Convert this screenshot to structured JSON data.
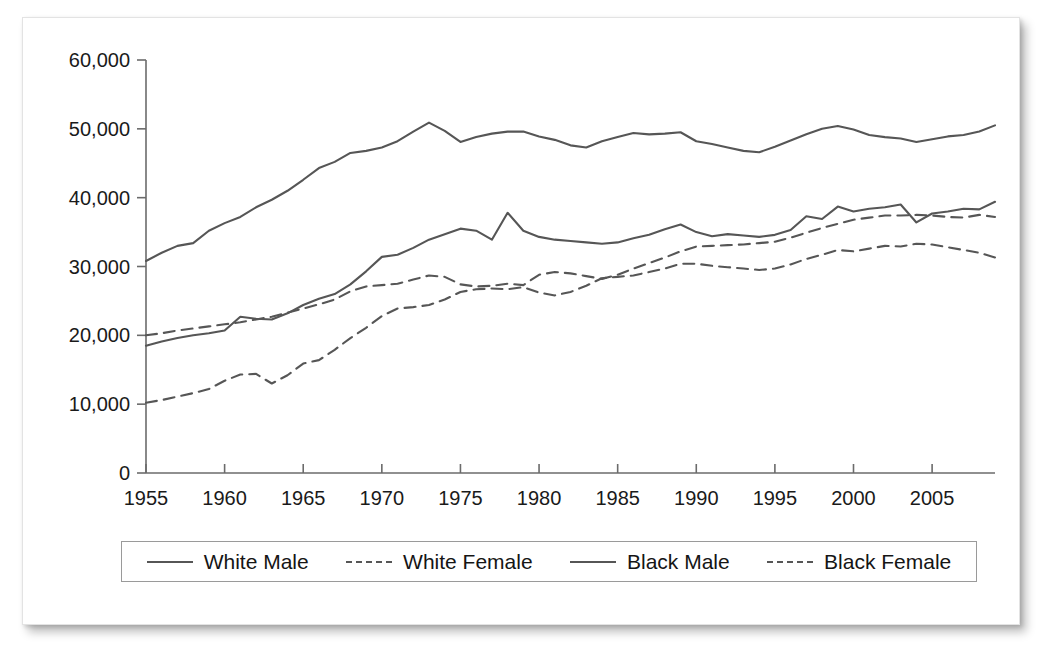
{
  "chart_data": {
    "type": "line",
    "title": "",
    "subtitle": "",
    "xlabel": "",
    "ylabel": "",
    "xlim": [
      1955,
      2009
    ],
    "ylim": [
      0,
      60000
    ],
    "grid": false,
    "legend_position": "bottom",
    "x_ticks": [
      1955,
      1960,
      1965,
      1970,
      1975,
      1980,
      1985,
      1990,
      1995,
      2000,
      2005
    ],
    "x_tick_labels": [
      "1955",
      "1960",
      "1965",
      "1970",
      "1975",
      "1980",
      "1985",
      "1990",
      "1995",
      "2000",
      "2005"
    ],
    "y_ticks": [
      0,
      10000,
      20000,
      30000,
      40000,
      50000,
      60000
    ],
    "y_tick_labels": [
      "0",
      "10,000",
      "20,000",
      "30,000",
      "40,000",
      "50,000",
      "60,000"
    ],
    "x": [
      1955,
      1956,
      1957,
      1958,
      1959,
      1960,
      1961,
      1962,
      1963,
      1964,
      1965,
      1966,
      1967,
      1968,
      1969,
      1970,
      1971,
      1972,
      1973,
      1974,
      1975,
      1976,
      1977,
      1978,
      1979,
      1980,
      1981,
      1982,
      1983,
      1984,
      1985,
      1986,
      1987,
      1988,
      1989,
      1990,
      1991,
      1992,
      1993,
      1994,
      1995,
      1996,
      1997,
      1998,
      1999,
      2000,
      2001,
      2002,
      2003,
      2004,
      2005,
      2006,
      2007,
      2008,
      2009
    ],
    "series": [
      {
        "name": "White Male",
        "style": "solid",
        "color": "#565656",
        "values": [
          30800,
          32000,
          33000,
          33400,
          35200,
          36300,
          37200,
          38600,
          39700,
          41000,
          42600,
          44300,
          45200,
          46500,
          46800,
          47300,
          48200,
          49600,
          50900,
          49700,
          48100,
          48800,
          49300,
          49600,
          49600,
          48900,
          48400,
          47600,
          47300,
          48200,
          48800,
          49400,
          49200,
          49300,
          49500,
          48200,
          47800,
          47300,
          46800,
          46600,
          47400,
          48300,
          49200,
          50000,
          50400,
          49900,
          49100,
          48800,
          48600,
          48100,
          48500,
          48900,
          49100,
          49600,
          50500
        ]
      },
      {
        "name": "White Female",
        "style": "dashed",
        "color": "#565656",
        "values": [
          20000,
          20300,
          20700,
          21000,
          21300,
          21600,
          21900,
          22300,
          22700,
          23300,
          23900,
          24500,
          25200,
          26400,
          27100,
          27300,
          27500,
          28100,
          28700,
          28500,
          27400,
          27100,
          27200,
          27500,
          27300,
          28800,
          29200,
          29000,
          28600,
          28200,
          28800,
          29700,
          30500,
          31300,
          32200,
          32900,
          33000,
          33100,
          33200,
          33400,
          33600,
          34200,
          34900,
          35600,
          36200,
          36800,
          37100,
          37400,
          37400,
          37500,
          37400,
          37200,
          37100,
          37500,
          37200
        ]
      },
      {
        "name": "Black Male",
        "style": "solid",
        "color": "#565656",
        "values": [
          18500,
          19100,
          19600,
          20000,
          20300,
          20700,
          22700,
          22400,
          22300,
          23200,
          24400,
          25300,
          26000,
          27400,
          29300,
          31400,
          31700,
          32700,
          33900,
          34700,
          35500,
          35200,
          33900,
          37800,
          35200,
          34300,
          33900,
          33700,
          33500,
          33300,
          33500,
          34100,
          34600,
          35400,
          36100,
          35000,
          34400,
          34700,
          34500,
          34300,
          34600,
          35300,
          37300,
          36900,
          38700,
          38000,
          38400,
          38600,
          39000,
          36400,
          37700,
          38000,
          38400,
          38300,
          39400
        ]
      },
      {
        "name": "Black Female",
        "style": "dashed",
        "color": "#565656",
        "values": [
          10200,
          10600,
          11100,
          11600,
          12200,
          13400,
          14300,
          14400,
          13000,
          14200,
          15900,
          16400,
          17900,
          19600,
          21100,
          22800,
          23900,
          24100,
          24400,
          25200,
          26300,
          26700,
          26800,
          26700,
          27000,
          26200,
          25800,
          26300,
          27200,
          28300,
          28500,
          28700,
          29200,
          29700,
          30400,
          30400,
          30100,
          29900,
          29700,
          29500,
          29700,
          30300,
          31100,
          31700,
          32400,
          32200,
          32600,
          33000,
          32900,
          33300,
          33200,
          32800,
          32400,
          32000,
          31300
        ]
      }
    ]
  },
  "legend": {
    "items": [
      {
        "label": "White Male",
        "style": "solid"
      },
      {
        "label": "White Female",
        "style": "dashed"
      },
      {
        "label": "Black Male",
        "style": "solid"
      },
      {
        "label": "Black Female",
        "style": "dashed"
      }
    ]
  }
}
